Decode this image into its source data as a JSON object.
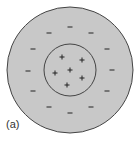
{
  "figure": {
    "label": "(a)",
    "colors": {
      "fill": "#c8c8c8",
      "stroke": "#444444",
      "background": "#ffffff",
      "sign": "#222222"
    },
    "outer_circle": {
      "cx": 70,
      "cy": 70,
      "r": 63,
      "charge": "negative"
    },
    "inner_circle": {
      "cx": 70,
      "cy": 70,
      "r": 26,
      "charge": "positive"
    },
    "plus_signs": [
      {
        "x": 62,
        "y": 57
      },
      {
        "x": 82,
        "y": 60
      },
      {
        "x": 55,
        "y": 73
      },
      {
        "x": 70,
        "y": 70
      },
      {
        "x": 82,
        "y": 78
      },
      {
        "x": 67,
        "y": 85
      }
    ],
    "minus_signs": [
      {
        "x": 70,
        "y": 27
      },
      {
        "x": 49,
        "y": 33
      },
      {
        "x": 91,
        "y": 33
      },
      {
        "x": 33,
        "y": 49
      },
      {
        "x": 107,
        "y": 49
      },
      {
        "x": 28,
        "y": 71
      },
      {
        "x": 112,
        "y": 70
      },
      {
        "x": 33,
        "y": 91
      },
      {
        "x": 107,
        "y": 91
      },
      {
        "x": 49,
        "y": 107
      },
      {
        "x": 91,
        "y": 107
      },
      {
        "x": 70,
        "y": 113
      }
    ]
  }
}
